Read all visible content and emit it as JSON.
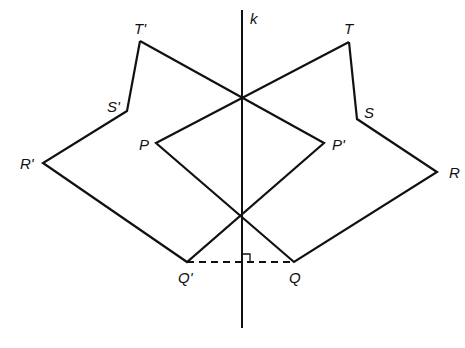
{
  "diagram": {
    "stroke_color": "#111111",
    "background": "#ffffff",
    "mirror_line": {
      "label": "k",
      "x1": 242,
      "y1": 10,
      "x2": 242,
      "y2": 328
    },
    "original_figure": {
      "vertices": [
        {
          "name": "P",
          "label": "P",
          "x": 156,
          "y": 143
        },
        {
          "name": "Q",
          "label": "Q",
          "x": 294,
          "y": 262
        },
        {
          "name": "R",
          "label": "R",
          "x": 437,
          "y": 172
        },
        {
          "name": "S",
          "label": "S",
          "x": 357,
          "y": 119
        },
        {
          "name": "T",
          "label": "T",
          "x": 349,
          "y": 42
        }
      ]
    },
    "image_figure": {
      "vertices": [
        {
          "name": "P'",
          "label": "P'",
          "x": 324,
          "y": 143
        },
        {
          "name": "Q'",
          "label": "Q'",
          "x": 187,
          "y": 262
        },
        {
          "name": "R'",
          "label": "R'",
          "x": 43,
          "y": 163
        },
        {
          "name": "S'",
          "label": "S'",
          "x": 127,
          "y": 111
        },
        {
          "name": "T'",
          "label": "T'",
          "x": 140,
          "y": 41
        }
      ]
    },
    "segment_QQprime": {
      "style": "dashed",
      "x1": 187,
      "y1": 262,
      "x2": 294,
      "y2": 262
    },
    "right_angle_marker": {
      "x": 242,
      "y": 262,
      "size": 8
    },
    "labels": {
      "k": "k",
      "P": "P",
      "Q": "Q",
      "R": "R",
      "S": "S",
      "T": "T",
      "P_prime": "P'",
      "Q_prime": "Q'",
      "R_prime": "R'",
      "S_prime": "S'",
      "T_prime": "T'"
    }
  }
}
